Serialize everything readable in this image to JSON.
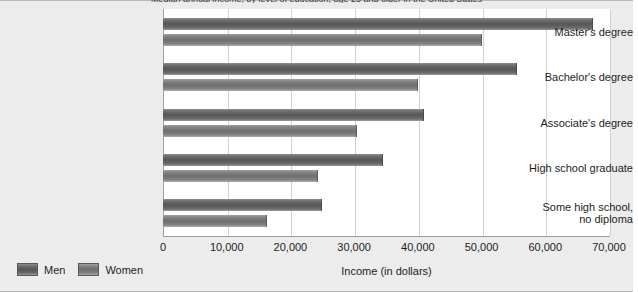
{
  "chart_data": {
    "type": "bar",
    "orientation": "horizontal",
    "title": "Median annual income, by level of education, age 25 and older in the United States",
    "xlabel": "Income (in dollars)",
    "ylabel": "",
    "xlim": [
      0,
      70000
    ],
    "xticks": [
      0,
      10000,
      20000,
      30000,
      40000,
      50000,
      60000,
      70000
    ],
    "xticklabels": [
      "0",
      "10,000",
      "20,000",
      "30,000",
      "40,000",
      "50,000",
      "60,000",
      "70,000"
    ],
    "grid": true,
    "legend_position": "bottom-left",
    "categories": [
      "Master's degree",
      "Bachelor's degree",
      "Associate's degree",
      "High school graduate",
      "Some high school, no diploma"
    ],
    "series": [
      {
        "name": "Men",
        "color": "#565658",
        "values": [
          67500,
          55600,
          41000,
          34500,
          25000
        ]
      },
      {
        "name": "Women",
        "color": "#6e6e70",
        "values": [
          50000,
          40000,
          30500,
          24300,
          16400
        ]
      }
    ]
  },
  "axis": {
    "categories": [
      {
        "line1": "Master's degree",
        "line2": ""
      },
      {
        "line1": "Bachelor's degree",
        "line2": ""
      },
      {
        "line1": "Associate's degree",
        "line2": ""
      },
      {
        "line1": "High school graduate",
        "line2": ""
      },
      {
        "line1": "Some high school,",
        "line2": "no diploma"
      }
    ]
  },
  "legend": {
    "items": [
      {
        "label": "Men"
      },
      {
        "label": "Women"
      }
    ]
  }
}
